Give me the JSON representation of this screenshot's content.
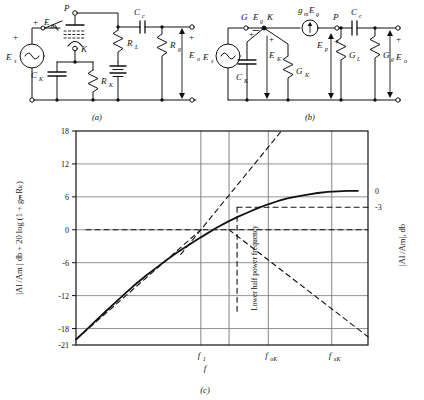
{
  "figure": {
    "caption_a": "(a)",
    "caption_b": "(b)",
    "caption_c": "(c)"
  },
  "circuit_a": {
    "name": "cathode-bypass amplifier circuit",
    "labels": {
      "source": "E",
      "source_sub": "s",
      "grid_signal": "E",
      "grid_signal_sub": "g",
      "plate": "P",
      "cathode": "K",
      "ck": "C",
      "ck_sub": "K",
      "rk": "R",
      "rk_sub": "K",
      "rl": "R",
      "rl_sub": "L",
      "cc": "C",
      "cc_sub": "c",
      "rg": "R",
      "rg_sub": "g",
      "eo": "E",
      "eo_sub": "o",
      "plus1": "+",
      "plus2": "+",
      "plus3": "+"
    }
  },
  "circuit_b": {
    "name": "equivalent small-signal circuit",
    "labels": {
      "source": "E",
      "source_sub": "s",
      "grid_node": "G",
      "cathode_node": "K",
      "plate_node": "P",
      "eg": "E",
      "eg_sub": "g",
      "ek": "E",
      "ek_sub": "K",
      "ep": "E",
      "ep_sub": "p",
      "gm_src": "g",
      "gm_sub": "m",
      "gm_eg": "E",
      "gm_eg_sub": "g",
      "ck": "C",
      "ck_sub": "K",
      "gk": "G",
      "gk_sub": "K",
      "gl": "G",
      "gl_sub": "L",
      "cc": "C",
      "cc_sub": "c",
      "gg": "G",
      "gg_sub": "g",
      "eo": "E",
      "eo_sub": "o",
      "plus1": "+",
      "plus2": "+",
      "plus3": "+",
      "plus4": "+"
    }
  },
  "chart_data": {
    "type": "line",
    "title": "",
    "xlabel": "f",
    "ylabel_left": "|Al /Am | db + 20 log (1 + gₘRₖ)",
    "ylabel_right": "|Al /Am|, db",
    "ylim": [
      -21,
      18
    ],
    "yticks": [
      18,
      12,
      6,
      0,
      -6,
      -12,
      -18,
      -21
    ],
    "ytick_labels": [
      "18",
      "12",
      "6",
      "0",
      "-6",
      "-12",
      "-18",
      "-21"
    ],
    "xticks": [
      "f₁",
      "fₒₖ",
      "fₓₖ"
    ],
    "xtick_parts": [
      {
        "base": "f",
        "sub": "1"
      },
      {
        "base": "f",
        "sub": "oK"
      },
      {
        "base": "f",
        "sub": "xK"
      }
    ],
    "right_axis_labels": [
      "0",
      "-3"
    ],
    "right_axis_values": [
      7.1,
      4.1
    ],
    "grid": true,
    "annotation": "Lower half power frequency",
    "series": [
      {
        "name": "actual response",
        "style": "solid",
        "points": [
          [
            0.0,
            -20.0
          ],
          [
            0.05,
            -18.3
          ],
          [
            0.1,
            -16.5
          ],
          [
            0.15,
            -14.8
          ],
          [
            0.2,
            -13.1
          ],
          [
            0.25,
            -11.4
          ],
          [
            0.3,
            -9.8
          ],
          [
            0.35,
            -8.3
          ],
          [
            0.4,
            -6.9
          ],
          [
            0.45,
            -5.5
          ],
          [
            0.5,
            -4.2
          ],
          [
            0.55,
            -3.0
          ],
          [
            0.6,
            -1.8
          ],
          [
            0.65,
            -0.7
          ],
          [
            0.7,
            0.4
          ],
          [
            0.75,
            1.4
          ],
          [
            0.8,
            2.3
          ],
          [
            0.85,
            3.1
          ],
          [
            0.9,
            3.9
          ],
          [
            0.95,
            4.6
          ],
          [
            1.0,
            5.2
          ],
          [
            1.05,
            5.7
          ],
          [
            1.1,
            6.1
          ],
          [
            1.15,
            6.4
          ],
          [
            1.2,
            6.7
          ],
          [
            1.25,
            6.9
          ],
          [
            1.3,
            7.0
          ],
          [
            1.35,
            7.1
          ],
          [
            1.4,
            7.1
          ]
        ]
      },
      {
        "name": "low-frequency asymptote",
        "style": "dashed",
        "points": [
          [
            0.0,
            -20.0
          ],
          [
            0.62,
            0.0
          ]
        ]
      },
      {
        "name": "zero-db asymptote",
        "style": "dashed",
        "points": [
          [
            0.05,
            0.0
          ],
          [
            1.45,
            0.0
          ]
        ]
      },
      {
        "name": "rising steep asymptote",
        "style": "dashed",
        "points": [
          [
            0.52,
            -4.5
          ],
          [
            1.02,
            18.0
          ]
        ]
      },
      {
        "name": "falling asymptote",
        "style": "dashed",
        "points": [
          [
            0.76,
            0.0
          ],
          [
            1.45,
            -19.5
          ]
        ]
      },
      {
        "name": "minus-3-db level",
        "style": "dashed",
        "points": [
          [
            0.8,
            4.1
          ],
          [
            1.45,
            4.1
          ]
        ]
      },
      {
        "name": "half-power vertical marker",
        "style": "dashed",
        "points": [
          [
            0.8,
            4.1
          ],
          [
            0.8,
            -15.0
          ]
        ]
      }
    ]
  }
}
